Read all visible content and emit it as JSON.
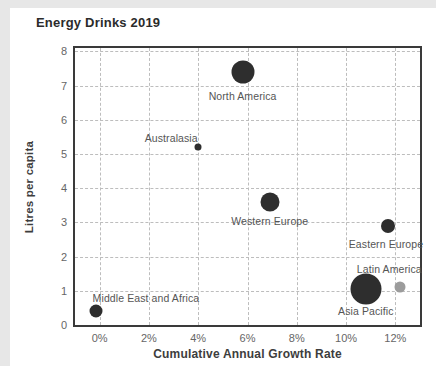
{
  "page": {
    "frame_color": "#e7e7e7",
    "background": "#ffffff"
  },
  "chart_data": {
    "type": "scatter",
    "subtype": "bubble",
    "title": "Energy Drinks 2019",
    "xlabel": "Cumulative Annual Growth Rate",
    "ylabel": "Litres per capita",
    "xlim": [
      -1,
      13
    ],
    "ylim": [
      0,
      8.1
    ],
    "grid": "dashed",
    "legend": "none",
    "default_point_color": "#2e2e2e",
    "label_color": "#555555",
    "x_ticks": [
      {
        "v": 0,
        "label": "0%"
      },
      {
        "v": 2,
        "label": "2%"
      },
      {
        "v": 4,
        "label": "4%"
      },
      {
        "v": 6,
        "label": "6%"
      },
      {
        "v": 8,
        "label": "8%"
      },
      {
        "v": 10,
        "label": "10%"
      },
      {
        "v": 12,
        "label": "12%"
      }
    ],
    "y_ticks": [
      {
        "v": 0,
        "label": "0"
      },
      {
        "v": 1,
        "label": "1"
      },
      {
        "v": 2,
        "label": "2"
      },
      {
        "v": 3,
        "label": "3"
      },
      {
        "v": 4,
        "label": "4"
      },
      {
        "v": 5,
        "label": "5"
      },
      {
        "v": 6,
        "label": "6"
      },
      {
        "v": 7,
        "label": "7"
      },
      {
        "v": 8,
        "label": "8"
      }
    ],
    "points": [
      {
        "name": "North America",
        "x": 5.8,
        "y": 7.4,
        "r_px": 11.5,
        "color": "#2e2e2e",
        "label_dx": 0,
        "label_dy": 24
      },
      {
        "name": "Australasia",
        "x": 4.0,
        "y": 5.2,
        "r_px": 3.5,
        "color": "#2e2e2e",
        "label_dx": -27,
        "label_dy": -9
      },
      {
        "name": "Western Europe",
        "x": 6.9,
        "y": 3.6,
        "r_px": 9.5,
        "color": "#2e2e2e",
        "label_dx": 0,
        "label_dy": 19
      },
      {
        "name": "Eastern Europe",
        "x": 11.7,
        "y": 2.9,
        "r_px": 7,
        "color": "#2e2e2e",
        "label_dx": -2,
        "label_dy": 18
      },
      {
        "name": "Latin America",
        "x": 12.2,
        "y": 1.1,
        "r_px": 5.5,
        "color": "#9c9c9c",
        "label_dx": -11,
        "label_dy": -18
      },
      {
        "name": "Asia Pacific",
        "x": 10.8,
        "y": 1.05,
        "r_px": 15.5,
        "color": "#2e2e2e",
        "label_dx": 0,
        "label_dy": 22
      },
      {
        "name": "Middle East and Africa",
        "x": -0.15,
        "y": 0.4,
        "r_px": 6.5,
        "color": "#2e2e2e",
        "label_dx": 50,
        "label_dy": -13
      }
    ]
  }
}
